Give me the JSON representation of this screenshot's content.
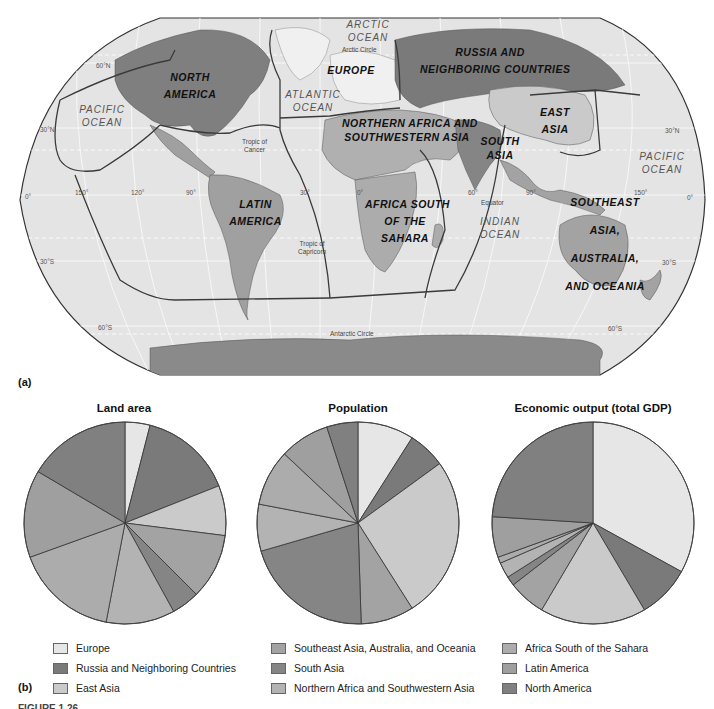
{
  "figure": {
    "panel_a_tag": "(a)",
    "panel_b_tag": "(b)",
    "caption_visible": "FIGURE 1.26"
  },
  "map": {
    "regions": [
      {
        "id": "north-america",
        "line1": "NORTH",
        "line2": "AMERICA"
      },
      {
        "id": "europe",
        "line1": "EUROPE",
        "line2": ""
      },
      {
        "id": "russia",
        "line1": "RUSSIA AND",
        "line2": "NEIGHBORING COUNTRIES"
      },
      {
        "id": "east-asia",
        "line1": "EAST",
        "line2": "ASIA"
      },
      {
        "id": "n-africa",
        "line1": "NORTHERN AFRICA AND",
        "line2": "SOUTHWESTERN ASIA"
      },
      {
        "id": "south-asia",
        "line1": "SOUTH",
        "line2": "ASIA"
      },
      {
        "id": "latin-america",
        "line1": "LATIN",
        "line2": "AMERICA"
      },
      {
        "id": "africa-south",
        "line1": "AFRICA SOUTH",
        "line2": "OF THE",
        "line3": "SAHARA"
      },
      {
        "id": "se-asia",
        "line1": "SOUTHEAST",
        "line2": "ASIA,",
        "line3": "AUSTRALIA,",
        "line4": "AND OCEANIA"
      }
    ],
    "oceans": {
      "arctic": [
        "ARCTIC",
        "OCEAN"
      ],
      "atlantic": [
        "ATLANTIC",
        "OCEAN"
      ],
      "pacific_west": [
        "PACIFIC",
        "OCEAN"
      ],
      "pacific_east": [
        "PACIFIC",
        "OCEAN"
      ],
      "indian": [
        "INDIAN",
        "OCEAN"
      ]
    },
    "lines": {
      "arctic_circle": "Arctic Circle",
      "tropic_cancer": [
        "Tropic of",
        "Cancer"
      ],
      "tropic_capricorn": [
        "Tropic of",
        "Capricorn"
      ],
      "equator": "Equator",
      "antarctic_circle": "Antarctic Circle"
    },
    "degrees": {
      "n60": "60°N",
      "n30_left": "30°N",
      "n30_right": "30°N",
      "zero_left": "0°",
      "zero_right": "0°",
      "s30_left": "30°S",
      "s30_right": "30°S",
      "s60_left": "60°S",
      "s60_right": "60°S",
      "lon150w": "150°",
      "lon120w": "120°",
      "lon90w": "90°",
      "lon30w": "30°",
      "lon0": "0°",
      "lon60e": "60°",
      "lon90e": "90°",
      "lon150e": "150°"
    }
  },
  "legend": {
    "items": [
      {
        "label": "Europe",
        "color": "#e6e6e6"
      },
      {
        "label": "Russia and Neighboring Countries",
        "color": "#7a7a7a"
      },
      {
        "label": "East Asia",
        "color": "#cacaca"
      },
      {
        "label": "Southeast Asia, Australia, and Oceania",
        "color": "#a3a3a3"
      },
      {
        "label": "South Asia",
        "color": "#858585"
      },
      {
        "label": "Northern Africa and Southwestern Asia",
        "color": "#b3b3b3"
      },
      {
        "label": "Africa South of the Sahara",
        "color": "#acacac"
      },
      {
        "label": "Latin America",
        "color": "#9f9f9f"
      },
      {
        "label": "North America",
        "color": "#808080"
      }
    ]
  },
  "chart_data": [
    {
      "type": "pie",
      "title": "Land area",
      "categories": [
        "Europe",
        "Russia and Neighboring Countries",
        "East Asia",
        "Southeast Asia, Australia, and Oceania",
        "South Asia",
        "Northern Africa and Southwestern Asia",
        "Africa South of the Sahara",
        "Latin America",
        "North America"
      ],
      "values": [
        4,
        15,
        8,
        10.5,
        4.5,
        11,
        16.5,
        14,
        16.5
      ],
      "start": "12 o'clock, clockwise",
      "legend_position": "bottom"
    },
    {
      "type": "pie",
      "title": "Population",
      "categories": [
        "Europe",
        "Russia and Neighboring Countries",
        "East Asia",
        "Southeast Asia, Australia, and Oceania",
        "South Asia",
        "Northern Africa and Southwestern Asia",
        "Africa South of the Sahara",
        "Latin America",
        "North America"
      ],
      "values": [
        9,
        6,
        26,
        8.5,
        21,
        7.5,
        9,
        8,
        5
      ],
      "start": "12 o'clock, clockwise",
      "legend_position": "bottom"
    },
    {
      "type": "pie",
      "title": "Economic output (total GDP)",
      "categories": [
        "Europe",
        "Russia and Neighboring Countries",
        "East Asia",
        "Southeast Asia, Australia, and Oceania",
        "South Asia",
        "Northern Africa and Southwestern Asia",
        "Africa South of the Sahara",
        "Latin America",
        "North America"
      ],
      "values": [
        33,
        8.5,
        17,
        6,
        1.5,
        2.5,
        1,
        6.5,
        24
      ],
      "start": "12 o'clock, clockwise",
      "legend_position": "bottom"
    }
  ]
}
